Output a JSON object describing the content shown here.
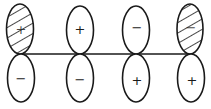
{
  "diagram": {
    "type": "p-orbital-phase-diagram",
    "axis": {
      "y": 54,
      "x_start": 20,
      "x_end": 191
    },
    "orbitals": [
      {
        "cx": 20,
        "top_sign": "+",
        "bottom_sign": "−",
        "top_hatched": true,
        "bottom_hatched": false
      },
      {
        "cx": 80,
        "top_sign": "+",
        "bottom_sign": "−",
        "top_hatched": false,
        "bottom_hatched": false
      },
      {
        "cx": 136,
        "top_sign": "−",
        "bottom_sign": "+",
        "top_hatched": false,
        "bottom_hatched": false
      },
      {
        "cx": 191,
        "top_sign": "−",
        "bottom_sign": "+",
        "top_hatched": true,
        "bottom_hatched": false
      }
    ],
    "colors": {
      "stroke": "#1a1a1a",
      "background": "#ffffff"
    }
  }
}
